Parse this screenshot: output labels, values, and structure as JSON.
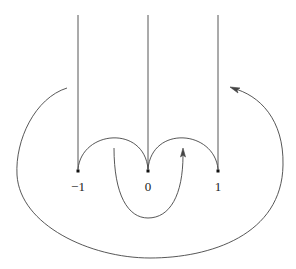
{
  "diagram": {
    "points": [
      {
        "label": "−1",
        "x": 78
      },
      {
        "label": "0",
        "x": 148
      },
      {
        "label": "1",
        "x": 218
      }
    ],
    "stroke_color": "#333333"
  }
}
